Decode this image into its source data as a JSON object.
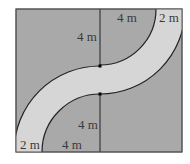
{
  "diagram": {
    "colors": {
      "background": "#ffffff",
      "field": "#a9a9a9",
      "path": "#d6d6d6",
      "lines": "#222222"
    },
    "labels": {
      "top_inner_radius": "4 m",
      "top_path_width": "2 m",
      "upper_vertical": "4 m",
      "lower_vertical": "4 m",
      "bottom_path_width": "2 m",
      "bottom_inner_radius": "4 m"
    }
  }
}
